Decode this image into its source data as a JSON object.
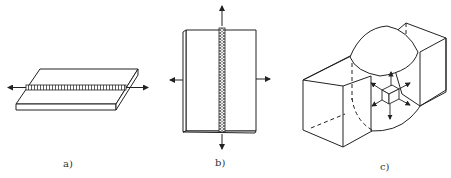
{
  "figure": {
    "panels": [
      {
        "id": "a",
        "label": "a)",
        "description": "Flat plate with horizontal weld bead, uniaxial stress along weld (arrows left/right)"
      },
      {
        "id": "b",
        "label": "b)",
        "description": "Plate with vertical weld bead, biaxial stress (arrows up/down and left/right)"
      },
      {
        "id": "c",
        "label": "c)",
        "description": "Thick block with weld region, triaxial stress on volume element (cube with arrows in 3 directions)"
      }
    ]
  },
  "colors": {
    "line": "#222222",
    "background": "#ffffff"
  }
}
